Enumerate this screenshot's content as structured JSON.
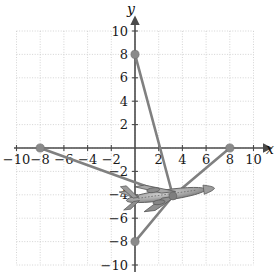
{
  "figure": {
    "title": "",
    "axis_labels": {
      "x": "x",
      "y": "y"
    },
    "colors": {
      "axis": "#4a4a4a",
      "grid": "#c9c9c9",
      "line": "#808080",
      "point": "#8a8a8a",
      "text": "#1a1a1a",
      "plane_body": "#9a9a9a",
      "plane_outline": "#5a5a5a"
    }
  },
  "chart_data": {
    "type": "line",
    "title": "",
    "xlabel": "x",
    "ylabel": "y",
    "xlim": [
      -10,
      10
    ],
    "ylim": [
      -10,
      10
    ],
    "grid": true,
    "legend": "none",
    "xticks": [
      -10,
      -8,
      -6,
      -4,
      -2,
      2,
      4,
      6,
      8,
      10
    ],
    "yticks": [
      10,
      8,
      6,
      4,
      2,
      -2,
      -4,
      -6,
      -8,
      -10
    ],
    "xtick_labels": [
      "-10",
      "-8",
      "-6",
      "-4",
      "-2",
      "2",
      "4",
      "6",
      "8",
      "10"
    ],
    "ytick_labels": [
      "10",
      "8",
      "6",
      "4",
      "2",
      "-2",
      "-4",
      "-6",
      "-8",
      "-10"
    ],
    "vertex": {
      "x": 3.2,
      "y": -4.1
    },
    "series": [
      {
        "name": "segment-to-(0,8)",
        "points": [
          [
            3.2,
            -4.1
          ],
          [
            0,
            8
          ]
        ]
      },
      {
        "name": "segment-to-(-8,0)",
        "points": [
          [
            3.2,
            -4.1
          ],
          [
            -8,
            0
          ]
        ]
      },
      {
        "name": "segment-to-(0,-8)",
        "points": [
          [
            3.2,
            -4.1
          ],
          [
            0,
            -8
          ]
        ]
      },
      {
        "name": "segment-to-(8,0)",
        "points": [
          [
            3.2,
            -4.1
          ],
          [
            8,
            0
          ]
        ]
      }
    ],
    "points": [
      {
        "label": "(0, 8)",
        "x": 0,
        "y": 8
      },
      {
        "label": "(-8, 0)",
        "x": -8,
        "y": 0
      },
      {
        "label": "(8, 0)",
        "x": 8,
        "y": 0
      },
      {
        "label": "(0, -8)",
        "x": 0,
        "y": -8
      }
    ],
    "annotations": [
      {
        "name": "airplane-illustration",
        "x": 2.4,
        "y": -4.0,
        "description": "grayscale airplane drawing centered near the vertex"
      }
    ]
  }
}
